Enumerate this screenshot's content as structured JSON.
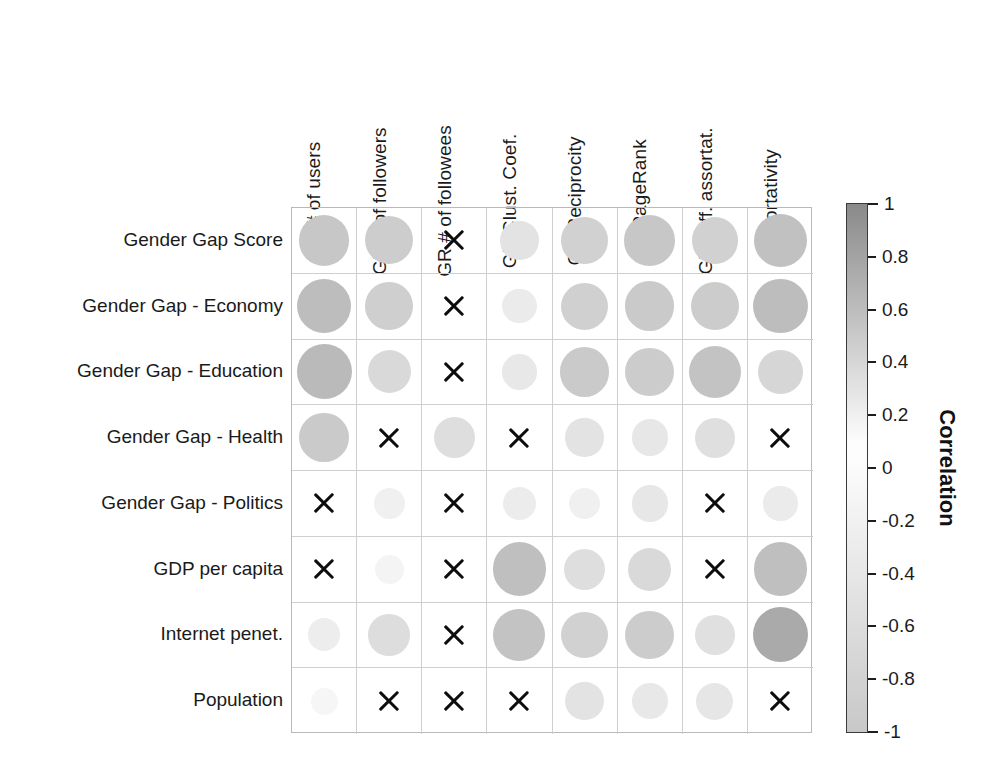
{
  "chart_data": {
    "type": "heatmap",
    "title": "",
    "subtitle": "",
    "xlabel": "",
    "ylabel": "",
    "grid": true,
    "legend_position": "right",
    "colorbar": {
      "label": "Correlation",
      "ticks": [
        1,
        0.8,
        0.6,
        0.4,
        0.2,
        0,
        -0.2,
        -0.4,
        -0.6,
        -0.8,
        -1
      ],
      "tick_labels": [
        "1",
        "0.8",
        "0.6",
        "0.4",
        "0.2",
        "0",
        "-0.2",
        "-0.4",
        "-0.6",
        "-0.8",
        "-1"
      ],
      "vmin": -1,
      "vmax": 1,
      "colormap": "diverging-grayscale",
      "color_at_max": "#8a8a8a",
      "color_at_mid": "#ffffff",
      "color_at_min": "#c9c9c9"
    },
    "marker_encoding": {
      "area_encodes": "absolute correlation magnitude",
      "color_encodes": "signed correlation value",
      "x_marker_means": "not statistically significant"
    },
    "categories": [
      "GR # of users",
      "GR # of followers",
      "GR # of followees",
      "GR Clust. Coef.",
      "GR Reciprocity",
      "GR PageRank",
      "GR Diff. assortat.",
      "Assortativity"
    ],
    "rows": [
      "Gender Gap Score",
      "Gender Gap - Economy",
      "Gender Gap - Education",
      "Gender Gap - Health",
      "Gender Gap - Politics",
      "GDP per capita",
      "Internet penet.",
      "Population"
    ],
    "cells": [
      [
        {
          "value": 0.52,
          "significant": true
        },
        {
          "value": 0.47,
          "significant": true
        },
        {
          "value": null,
          "significant": false
        },
        {
          "value": 0.3,
          "significant": true
        },
        {
          "value": 0.44,
          "significant": true
        },
        {
          "value": 0.52,
          "significant": true
        },
        {
          "value": 0.44,
          "significant": true
        },
        {
          "value": 0.57,
          "significant": true
        }
      ],
      [
        {
          "value": 0.6,
          "significant": true
        },
        {
          "value": 0.46,
          "significant": true
        },
        {
          "value": null,
          "significant": false
        },
        {
          "value": 0.24,
          "significant": true
        },
        {
          "value": 0.45,
          "significant": true
        },
        {
          "value": 0.5,
          "significant": true
        },
        {
          "value": 0.48,
          "significant": true
        },
        {
          "value": 0.6,
          "significant": true
        }
      ],
      [
        {
          "value": 0.62,
          "significant": true
        },
        {
          "value": 0.38,
          "significant": true
        },
        {
          "value": null,
          "significant": false
        },
        {
          "value": 0.26,
          "significant": true
        },
        {
          "value": 0.5,
          "significant": true
        },
        {
          "value": 0.48,
          "significant": true
        },
        {
          "value": 0.55,
          "significant": true
        },
        {
          "value": 0.4,
          "significant": true
        }
      ],
      [
        {
          "value": 0.5,
          "significant": true
        },
        {
          "value": null,
          "significant": false
        },
        {
          "value": 0.34,
          "significant": true
        },
        {
          "value": null,
          "significant": false
        },
        {
          "value": 0.3,
          "significant": true
        },
        {
          "value": 0.27,
          "significant": true
        },
        {
          "value": 0.33,
          "significant": true
        },
        {
          "value": null,
          "significant": false
        }
      ],
      [
        {
          "value": null,
          "significant": false
        },
        {
          "value": 0.2,
          "significant": true
        },
        {
          "value": null,
          "significant": false
        },
        {
          "value": 0.23,
          "significant": true
        },
        {
          "value": 0.2,
          "significant": true
        },
        {
          "value": 0.27,
          "significant": true
        },
        {
          "value": null,
          "significant": false
        },
        {
          "value": 0.24,
          "significant": true
        }
      ],
      [
        {
          "value": null,
          "significant": false
        },
        {
          "value": 0.17,
          "significant": true
        },
        {
          "value": null,
          "significant": false
        },
        {
          "value": 0.58,
          "significant": true
        },
        {
          "value": 0.34,
          "significant": true
        },
        {
          "value": 0.38,
          "significant": true
        },
        {
          "value": null,
          "significant": false
        },
        {
          "value": 0.58,
          "significant": true
        }
      ],
      [
        {
          "value": 0.22,
          "significant": true
        },
        {
          "value": 0.35,
          "significant": true
        },
        {
          "value": null,
          "significant": false
        },
        {
          "value": 0.55,
          "significant": true
        },
        {
          "value": 0.44,
          "significant": true
        },
        {
          "value": 0.48,
          "significant": true
        },
        {
          "value": 0.32,
          "significant": true
        },
        {
          "value": 0.75,
          "significant": true
        }
      ],
      [
        {
          "value": 0.15,
          "significant": true
        },
        {
          "value": null,
          "significant": false
        },
        {
          "value": null,
          "significant": false
        },
        {
          "value": null,
          "significant": false
        },
        {
          "value": 0.3,
          "significant": true
        },
        {
          "value": 0.26,
          "significant": true
        },
        {
          "value": 0.28,
          "significant": true
        },
        {
          "value": null,
          "significant": false
        }
      ]
    ]
  }
}
